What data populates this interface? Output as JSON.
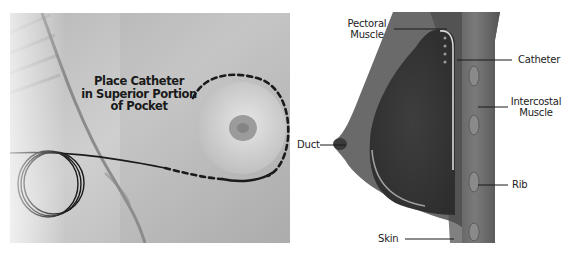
{
  "figure": {
    "left_panel": {
      "type": "photograph",
      "caption_lines": [
        "Place Catheter",
        "in Superior Portion",
        "of Pocket"
      ],
      "annotations": {
        "dashed_outline": "breast pocket outline",
        "coiled_catheter": "catheter coil"
      }
    },
    "right_panel": {
      "type": "anatomical cross-section diagram",
      "labels": {
        "pectoral_muscle": [
          "Pectoral",
          "Muscle"
        ],
        "catheter": "Catheter",
        "intercostal_muscle": [
          "Intercostal",
          "Muscle"
        ],
        "duct": "Duct",
        "rib": "Rib",
        "skin": "Skin"
      }
    },
    "colors": {
      "background": "#ffffff",
      "photo_base": "#c8c8c8",
      "tissue_dark": "#3a3a3a",
      "tissue_mid": "#6e6e6e",
      "label_text": "#222222",
      "leader_line": "#1a1a1a"
    }
  }
}
